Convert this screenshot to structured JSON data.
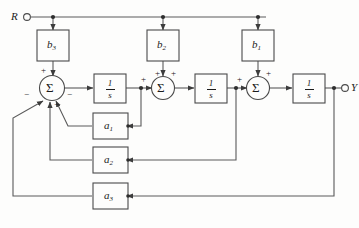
{
  "diagram": {
    "input_terminal": {
      "label": "R",
      "name": "input-terminal-r"
    },
    "output_terminal": {
      "label": "Y",
      "name": "output-terminal-y"
    },
    "feedforward_gains": [
      {
        "id": "b3",
        "label": "b",
        "subscript": "3"
      },
      {
        "id": "b2",
        "label": "b",
        "subscript": "2"
      },
      {
        "id": "b1",
        "label": "b",
        "subscript": "1"
      }
    ],
    "feedback_gains": [
      {
        "id": "a1",
        "label": "a",
        "subscript": "1"
      },
      {
        "id": "a2",
        "label": "a",
        "subscript": "2"
      },
      {
        "id": "a3",
        "label": "a",
        "subscript": "3"
      }
    ],
    "integrators": [
      {
        "id": "int1",
        "numerator": "1",
        "denominator": "s"
      },
      {
        "id": "int2",
        "numerator": "1",
        "denominator": "s"
      },
      {
        "id": "int3",
        "numerator": "1",
        "denominator": "s"
      }
    ],
    "summers": [
      {
        "id": "sum1",
        "symbol": "Σ",
        "signs": [
          {
            "position": "top",
            "sign": "+"
          },
          {
            "position": "left",
            "sign": "−"
          },
          {
            "position": "right",
            "sign": "−"
          },
          {
            "position": "bottom",
            "sign": "−"
          }
        ]
      },
      {
        "id": "sum2",
        "symbol": "Σ",
        "signs": [
          {
            "position": "left",
            "sign": "+"
          },
          {
            "position": "top-left",
            "sign": "+"
          },
          {
            "position": "top-right",
            "sign": "+"
          }
        ]
      },
      {
        "id": "sum3",
        "symbol": "Σ",
        "signs": [
          {
            "position": "left",
            "sign": "+"
          },
          {
            "position": "top-right",
            "sign": "+"
          }
        ]
      }
    ],
    "colors": {
      "line": "#5a5a5a",
      "box_stroke": "#4a4a4a",
      "text": "#1b1b1b",
      "background": "#fdfdfc"
    }
  }
}
